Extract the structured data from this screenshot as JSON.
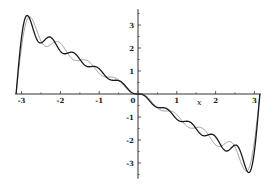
{
  "chart_data": {
    "type": "line",
    "title": "",
    "xlabel": "x",
    "ylabel": "",
    "xlim": [
      -3.1416,
      3.1416
    ],
    "ylim": [
      -3.6,
      3.6
    ],
    "grid": false,
    "legend": null,
    "x_ticks": [
      -3,
      -2,
      -1,
      0,
      1,
      2,
      3
    ],
    "x_tick_labels": [
      "-3",
      "-2",
      "-1",
      "0",
      "1",
      "2",
      "3"
    ],
    "y_ticks": [
      -3,
      -2,
      -1,
      1,
      2,
      3
    ],
    "y_tick_labels": [
      "-3",
      "-2",
      "-1",
      "1",
      "2",
      "3"
    ],
    "series": [
      {
        "name": "partial sum (more terms)",
        "formula": "sum_{n=1..N} 2(-1)^n sin(n x)/n",
        "terms": 10,
        "color": "#1a1a1a",
        "width": 1.3,
        "sample_points": {
          "x": [
            -3.14,
            -3.0,
            -2.0,
            -1.0,
            0,
            1.0,
            2.0,
            3.0,
            3.14
          ],
          "y": [
            0,
            3.5,
            2.0,
            1.0,
            0,
            -1.0,
            -2.0,
            -3.5,
            0
          ]
        }
      },
      {
        "name": "partial sum (fewer terms)",
        "formula": "sum_{n=1..N} 2(-1)^n sin(n x)/n",
        "terms": 8,
        "color": "#8c8c8c",
        "width": 0.9,
        "sample_points": {
          "x": [
            -3.14,
            -2.85,
            -2.0,
            -1.0,
            0,
            1.0,
            2.0,
            2.85,
            3.14
          ],
          "y": [
            0,
            3.45,
            2.0,
            1.0,
            0,
            -1.0,
            -2.0,
            -3.45,
            0
          ]
        }
      }
    ]
  },
  "axes": {
    "x_label": "x",
    "x_origin_label": "0"
  }
}
